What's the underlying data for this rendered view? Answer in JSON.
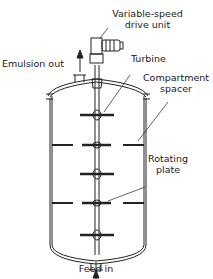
{
  "diagram": {
    "labels": {
      "drive_line1": "Variable-speed",
      "drive_line2": "drive unit",
      "emulsion_out": "Emulsion out",
      "turbine": "Turbine",
      "spacer_line1": "Compartment",
      "spacer_line2": "spacer",
      "plate_line1": "Rotating",
      "plate_line2": "plate",
      "feed_in": "Feed in"
    },
    "colors": {
      "line": "#222222",
      "background": "#ffffff"
    }
  }
}
